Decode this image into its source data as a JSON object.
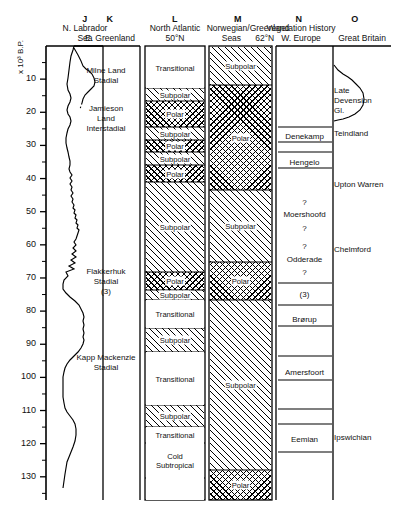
{
  "figure": {
    "axis": {
      "label": "x 10³ B.P.",
      "ticks": [
        10,
        20,
        30,
        40,
        50,
        60,
        70,
        80,
        90,
        100,
        110,
        120,
        130
      ],
      "min": 0,
      "max": 137
    },
    "columns": [
      {
        "letter": "J",
        "header": "N. Labrador\nSea",
        "type": "curve"
      },
      {
        "letter": "K",
        "header": "E. Greenland",
        "type": "text",
        "entries": [
          {
            "text": "Milne Land\nStadial",
            "top": 66
          },
          {
            "text": "Jamieson\nLand\nInterstadial",
            "top": 104
          },
          {
            "text": "Flakkerhuk\nStadial\n(3)",
            "top": 267
          },
          {
            "text": "Kapp Mackenzie\nStadial",
            "top": 353
          }
        ]
      },
      {
        "letter": "L",
        "header": "North Atlantic\n50°N",
        "type": "zones",
        "zones": [
          {
            "label": "Transitional",
            "fill": "none",
            "top": 47,
            "bottom": 88
          },
          {
            "label": "Subpolar",
            "fill": "subpolar",
            "top": 88,
            "bottom": 101
          },
          {
            "label": "Polar",
            "fill": "polar",
            "top": 101,
            "bottom": 127
          },
          {
            "label": "Subpolar",
            "fill": "subpolar",
            "top": 127,
            "bottom": 140
          },
          {
            "label": "Polar",
            "fill": "polar",
            "top": 140,
            "bottom": 152
          },
          {
            "label": "Subpolar",
            "fill": "subpolar",
            "top": 152,
            "bottom": 165
          },
          {
            "label": "Polar",
            "fill": "polar",
            "top": 165,
            "bottom": 182
          },
          {
            "label": "Subpolar",
            "fill": "subpolar",
            "top": 182,
            "bottom": 272
          },
          {
            "label": "Polar",
            "fill": "polar",
            "top": 272,
            "bottom": 290
          },
          {
            "label": "Subpolar",
            "fill": "subpolar",
            "top": 290,
            "bottom": 300
          },
          {
            "label": "Transitional",
            "fill": "none",
            "top": 300,
            "bottom": 328
          },
          {
            "label": "Subpolar",
            "fill": "subpolar",
            "top": 328,
            "bottom": 352
          },
          {
            "label": "Transitional",
            "fill": "none",
            "top": 352,
            "bottom": 405
          },
          {
            "label": "Subpolar",
            "fill": "subpolar",
            "top": 405,
            "bottom": 427
          },
          {
            "label": "Transitional",
            "fill": "none",
            "top": 427,
            "bottom": 443
          },
          {
            "label": "Cold\nSubtropical",
            "fill": "none",
            "top": 443,
            "bottom": 478
          },
          {
            "label": "",
            "fill": "none",
            "top": 478,
            "bottom": 500
          }
        ]
      },
      {
        "letter": "M",
        "header": "Norwegian/Greenland\nSeas      62°N",
        "type": "zones",
        "zones": [
          {
            "label": "Subpolar",
            "fill": "subpolar",
            "top": 47,
            "bottom": 85
          },
          {
            "label": "Polar",
            "fill": "polar",
            "top": 85,
            "bottom": 190
          },
          {
            "label": "Subpolar",
            "fill": "subpolar",
            "top": 190,
            "bottom": 262
          },
          {
            "label": "Polar",
            "fill": "polar",
            "top": 262,
            "bottom": 300
          },
          {
            "label": "Subpolar",
            "fill": "subpolar",
            "top": 300,
            "bottom": 470
          },
          {
            "label": "Polar",
            "fill": "polar",
            "top": 470,
            "bottom": 500
          }
        ]
      },
      {
        "letter": "N",
        "header": "Vegetation History\nW. Europe",
        "type": "bands",
        "entries": [
          {
            "text": "Denekamp",
            "top": 132,
            "rule_above": true,
            "rule_below": true
          },
          {
            "text": "Hengelo",
            "top": 158,
            "rule_above": true,
            "rule_below": true
          },
          {
            "text": "?",
            "top": 198,
            "rule_above": false,
            "rule_below": false
          },
          {
            "text": "Moershoofd",
            "top": 210,
            "rule_above": false,
            "rule_below": false
          },
          {
            "text": "?",
            "top": 224,
            "rule_above": false,
            "rule_below": false
          },
          {
            "text": "?",
            "top": 242,
            "rule_above": false,
            "rule_below": false
          },
          {
            "text": "Odderade",
            "top": 255,
            "rule_above": false,
            "rule_below": false
          },
          {
            "text": "?",
            "top": 268,
            "rule_above": false,
            "rule_below": false
          },
          {
            "text": "(3)",
            "top": 290,
            "rule_above": false,
            "rule_below": true
          },
          {
            "text": "Brørup",
            "top": 315,
            "rule_above": true,
            "rule_below": true
          },
          {
            "text": "Amersfoort",
            "top": 368,
            "rule_above": true,
            "rule_below": true
          },
          {
            "text": "Eemian",
            "top": 435,
            "rule_above": true,
            "rule_below": true
          }
        ]
      },
      {
        "letter": "O",
        "header": "Great Britain",
        "type": "curve_text",
        "entries": [
          {
            "text": "Late\nDevension\nGl.",
            "top": 86
          },
          {
            "text": "Teindland",
            "top": 129
          },
          {
            "text": "Upton Warren",
            "top": 180
          },
          {
            "text": "Chelmford",
            "top": 245
          },
          {
            "text": "Ipswichian",
            "top": 433
          }
        ]
      }
    ]
  }
}
